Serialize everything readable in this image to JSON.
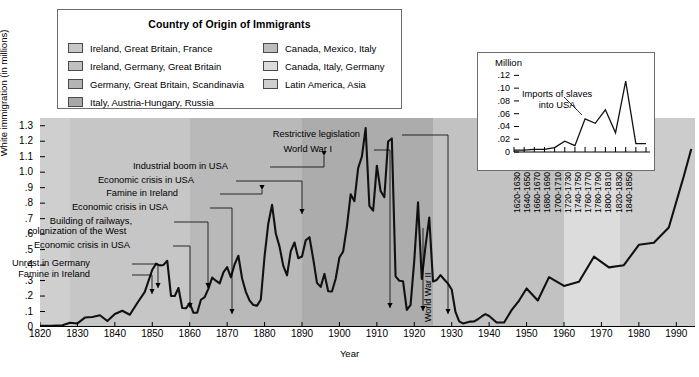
{
  "legend": {
    "title": "Country of Origin of Immigrants",
    "left_items": [
      {
        "label": "Ireland, Great Britain, France",
        "color": "#c8c8c8"
      },
      {
        "label": "Ireland, Germany, Great Britain",
        "color": "#c0c0c0"
      },
      {
        "label": "Germany, Great Britain, Scandinavia",
        "color": "#b4b4b4"
      },
      {
        "label": "Italy, Austria-Hungary, Russia",
        "color": "#a8a8a8"
      }
    ],
    "right_items": [
      {
        "label": "Canada, Mexico, Italy",
        "color": "#bdbdbd"
      },
      {
        "label": "Canada, Italy, Germany",
        "color": "#dcdcdc"
      },
      {
        "label": "Latin America, Asia",
        "color": "#cfcfcf"
      }
    ]
  },
  "annotations": [
    {
      "name": "unrest-in-germany",
      "text": "Unrest in Germany"
    },
    {
      "name": "famine-in-ireland-1",
      "text": "Famine in Ireland"
    },
    {
      "name": "economic-crisis-1",
      "text": "Economic crisis in USA"
    },
    {
      "name": "building-of-railways",
      "text": "Building of railways,"
    },
    {
      "name": "colonization-of-the-west",
      "text": "colonization of the West"
    },
    {
      "name": "economic-crisis-2",
      "text": "Economic crisis in USA"
    },
    {
      "name": "famine-in-ireland-2",
      "text": "Famine in Ireland"
    },
    {
      "name": "economic-crisis-3",
      "text": "Economic crisis in USA"
    },
    {
      "name": "industrial-boom",
      "text": "Industrial boom in USA"
    },
    {
      "name": "world-war-i",
      "text": "World War I"
    },
    {
      "name": "restrictive-legislation",
      "text": "Restrictive legislation"
    },
    {
      "name": "world-war-ii",
      "text": "World War II"
    }
  ],
  "inset": {
    "unit": "Million",
    "note_line1": "Imports of slaves",
    "note_line2": "into USA"
  },
  "chart_data": {
    "type": "line",
    "title": "Country of Origin of Immigrants",
    "xlabel": "Year",
    "ylabel": "White immigration (in millions)",
    "xlim": [
      1820,
      1995
    ],
    "ylim": [
      0,
      1.35
    ],
    "yticks": [
      "0",
      ".1",
      ".2",
      ".3",
      ".4",
      ".5",
      ".6",
      ".7",
      ".8",
      ".9",
      "1.0",
      "1.1",
      "1.2",
      "1.3"
    ],
    "ytick_values": [
      0,
      0.1,
      0.2,
      0.3,
      0.4,
      0.5,
      0.6,
      0.7,
      0.8,
      0.9,
      1.0,
      1.1,
      1.2,
      1.3
    ],
    "xticks": [
      "1820",
      "1830",
      "1840",
      "1850",
      "1860",
      "1870",
      "1880",
      "1890",
      "1900",
      "1910",
      "1920",
      "1930",
      "1940",
      "1950",
      "1960",
      "1970",
      "1980",
      "1990"
    ],
    "xtick_values": [
      1820,
      1830,
      1840,
      1850,
      1860,
      1870,
      1880,
      1890,
      1900,
      1910,
      1920,
      1930,
      1940,
      1950,
      1960,
      1970,
      1980,
      1990
    ],
    "grid": false,
    "legend_position": "top-left-external",
    "series": [
      {
        "name": "White immigration (in millions)",
        "x": [
          1820,
          1823,
          1826,
          1828,
          1830,
          1832,
          1834,
          1836,
          1838,
          1840,
          1842,
          1844,
          1846,
          1848,
          1850,
          1851,
          1852,
          1853,
          1854,
          1855,
          1856,
          1857,
          1858,
          1859,
          1860,
          1861,
          1862,
          1863,
          1864,
          1865,
          1866,
          1867,
          1868,
          1869,
          1870,
          1871,
          1872,
          1873,
          1874,
          1875,
          1876,
          1877,
          1878,
          1879,
          1880,
          1881,
          1882,
          1883,
          1884,
          1885,
          1886,
          1887,
          1888,
          1889,
          1890,
          1891,
          1892,
          1893,
          1894,
          1895,
          1896,
          1897,
          1898,
          1899,
          1900,
          1901,
          1902,
          1903,
          1904,
          1905,
          1906,
          1907,
          1908,
          1909,
          1910,
          1911,
          1912,
          1913,
          1914,
          1915,
          1916,
          1917,
          1918,
          1919,
          1920,
          1921,
          1922,
          1923,
          1924,
          1925,
          1926,
          1927,
          1928,
          1929,
          1930,
          1931,
          1932,
          1933,
          1934,
          1935,
          1936,
          1937,
          1938,
          1939,
          1940,
          1942,
          1944,
          1946,
          1948,
          1950,
          1953,
          1956,
          1960,
          1964,
          1968,
          1972,
          1976,
          1980,
          1984,
          1988,
          1992,
          1994
        ],
        "y": [
          0.008,
          0.007,
          0.011,
          0.028,
          0.023,
          0.061,
          0.065,
          0.076,
          0.039,
          0.084,
          0.105,
          0.079,
          0.155,
          0.227,
          0.37,
          0.409,
          0.398,
          0.401,
          0.428,
          0.201,
          0.2,
          0.252,
          0.123,
          0.121,
          0.154,
          0.092,
          0.092,
          0.176,
          0.193,
          0.248,
          0.319,
          0.299,
          0.282,
          0.353,
          0.387,
          0.321,
          0.405,
          0.46,
          0.313,
          0.227,
          0.17,
          0.142,
          0.138,
          0.178,
          0.457,
          0.669,
          0.789,
          0.604,
          0.519,
          0.395,
          0.334,
          0.49,
          0.546,
          0.444,
          0.455,
          0.56,
          0.58,
          0.44,
          0.285,
          0.259,
          0.343,
          0.231,
          0.229,
          0.312,
          0.449,
          0.488,
          0.649,
          0.857,
          0.813,
          1.026,
          1.101,
          1.285,
          0.783,
          0.752,
          1.042,
          0.878,
          0.838,
          1.198,
          1.218,
          0.327,
          0.299,
          0.295,
          0.11,
          0.141,
          0.43,
          0.805,
          0.31,
          0.523,
          0.707,
          0.294,
          0.304,
          0.335,
          0.307,
          0.28,
          0.242,
          0.097,
          0.036,
          0.023,
          0.029,
          0.035,
          0.036,
          0.05,
          0.068,
          0.083,
          0.071,
          0.029,
          0.029,
          0.109,
          0.171,
          0.249,
          0.171,
          0.322,
          0.265,
          0.292,
          0.454,
          0.385,
          0.399,
          0.531,
          0.544,
          0.643,
          0.974,
          1.15
        ]
      }
    ],
    "background_bands": [
      {
        "from": 1820,
        "to": 1828,
        "color": "#cfcfcf",
        "origins": "Ireland, Great Britain, France"
      },
      {
        "from": 1828,
        "to": 1860,
        "color": "#c6c6c6",
        "origins": "Ireland, Germany, Great Britain"
      },
      {
        "from": 1860,
        "to": 1890,
        "color": "#b9b9b9",
        "origins": "Germany, Great Britain, Scandinavia"
      },
      {
        "from": 1890,
        "to": 1925,
        "color": "#acacac",
        "origins": "Italy, Austria-Hungary, Russia"
      },
      {
        "from": 1925,
        "to": 1960,
        "color": "#c2c2c2",
        "origins": "Canada, Mexico, Italy"
      },
      {
        "from": 1960,
        "to": 1975,
        "color": "#dcdcdc",
        "origins": "Canada, Italy, Germany"
      },
      {
        "from": 1975,
        "to": 1995,
        "color": "#cccccc",
        "origins": "Latin America, Asia"
      }
    ],
    "annotation_points": [
      {
        "label": "Unrest in Germany",
        "year": 1848,
        "value": 0.227
      },
      {
        "label": "Famine in Ireland",
        "year": 1850,
        "value": 0.37
      },
      {
        "label": "Economic crisis in USA",
        "year": 1858,
        "value": 0.123
      },
      {
        "label": "Building of railways, colonization of the West",
        "year": 1869,
        "value": 0.353
      },
      {
        "label": "Economic crisis in USA",
        "year": 1877,
        "value": 0.142
      },
      {
        "label": "Famine in Ireland",
        "year": 1882,
        "value": 0.789
      },
      {
        "label": "Economic crisis in USA",
        "year": 1894,
        "value": 0.285
      },
      {
        "label": "Industrial boom in USA",
        "year": 1907,
        "value": 1.285
      },
      {
        "label": "World War I",
        "year": 1918,
        "value": 0.11
      },
      {
        "label": "Restrictive legislation",
        "year": 1932,
        "value": 0.036
      },
      {
        "label": "World War II",
        "year": 1943,
        "value": 0.029
      }
    ],
    "inset_chart": {
      "type": "line",
      "title": "Imports of slaves into USA",
      "ylabel": "Million",
      "ylim": [
        0,
        0.13
      ],
      "yticks": [
        "0",
        ".02",
        ".04",
        ".06",
        ".08",
        ".10",
        ".12"
      ],
      "ytick_values": [
        0,
        0.02,
        0.04,
        0.06,
        0.08,
        0.1,
        0.12
      ],
      "categories": [
        "1620-1630",
        "1640-1650",
        "1660-1670",
        "1680-1690",
        "1700-1710",
        "1720-1730",
        "1740-1750",
        "1760-1770",
        "1780-1790",
        "1800-1810",
        "1820-1830",
        "1840-1850"
      ],
      "values": [
        0.003,
        0.003,
        0.004,
        0.004,
        0.007,
        0.017,
        0.01,
        0.052,
        0.045,
        0.066,
        0.03,
        0.111,
        0.013,
        0.013
      ],
      "x_points": [
        0,
        1,
        2,
        3,
        4,
        5,
        6,
        7,
        8,
        9,
        10,
        11,
        12,
        13
      ]
    }
  }
}
